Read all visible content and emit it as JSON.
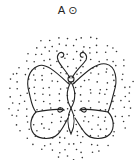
{
  "header": {
    "letter": "A",
    "symbol": "⊙"
  },
  "figure": {
    "background": "dotted-circle",
    "stroke_color": "#222222",
    "dot_color": "#333333"
  }
}
